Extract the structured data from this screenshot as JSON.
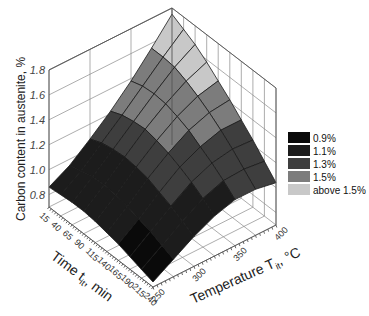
{
  "chart_data": {
    "type": "surface3d",
    "title": "",
    "zlabel": "Carbon content in austenite, %",
    "xlabel": {
      "main": "Time t",
      "sub": "it",
      "unit": ", min"
    },
    "ylabel": {
      "main": "Temperature T",
      "sub": "it",
      "unit": ", °C"
    },
    "x_name": "time_min",
    "y_name": "temperature_C",
    "x_ticks": [
      "15",
      "40",
      "65",
      "90",
      "115",
      "140",
      "165",
      "190",
      "215",
      "240"
    ],
    "y_ticks": [
      "250",
      "300",
      "350",
      "400"
    ],
    "z_ticks": [
      "0.8",
      "1.0",
      "1.2",
      "1.4",
      "1.6",
      "1.8"
    ],
    "xlim": [
      15,
      240
    ],
    "ylim": [
      250,
      400
    ],
    "zlim": [
      0.7,
      1.8
    ],
    "x": [
      15,
      40,
      65,
      90,
      115,
      140,
      165,
      190,
      215,
      240
    ],
    "y": [
      250,
      275,
      300,
      325,
      350,
      375,
      400
    ],
    "z": [
      [
        0.86,
        0.95,
        1.08,
        1.22,
        1.38,
        1.56,
        1.75
      ],
      [
        0.87,
        0.98,
        1.12,
        1.26,
        1.41,
        1.56,
        1.7
      ],
      [
        0.88,
        1.0,
        1.14,
        1.28,
        1.42,
        1.55,
        1.65
      ],
      [
        0.88,
        1.01,
        1.15,
        1.29,
        1.41,
        1.51,
        1.58
      ],
      [
        0.87,
        1.0,
        1.14,
        1.27,
        1.38,
        1.46,
        1.5
      ],
      [
        0.85,
        0.98,
        1.12,
        1.24,
        1.34,
        1.4,
        1.42
      ],
      [
        0.83,
        0.95,
        1.08,
        1.2,
        1.28,
        1.33,
        1.33
      ],
      [
        0.8,
        0.92,
        1.04,
        1.15,
        1.22,
        1.25,
        1.24
      ],
      [
        0.77,
        0.88,
        0.99,
        1.09,
        1.15,
        1.16,
        1.14
      ],
      [
        0.74,
        0.84,
        0.94,
        1.02,
        1.07,
        1.07,
        1.04
      ]
    ],
    "legend": {
      "placement": "right",
      "entries": [
        {
          "label": "0.9%",
          "color": "#0a0a0a"
        },
        {
          "label": "1.1%",
          "color": "#1c1c1c"
        },
        {
          "label": "1.3%",
          "color": "#3e3e3e"
        },
        {
          "label": "1.5%",
          "color": "#7c7c7c"
        },
        {
          "label": "above 1.5%",
          "color": "#c8c8c8"
        }
      ],
      "thresholds": [
        0.9,
        1.1,
        1.3,
        1.5
      ]
    },
    "grid": true
  }
}
